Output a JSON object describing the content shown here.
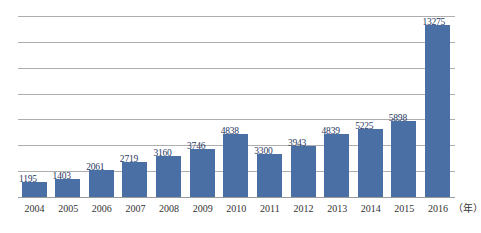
{
  "chart_data": {
    "type": "bar",
    "title": "",
    "xlabel": "年",
    "ylabel": "",
    "categories": [
      "2004",
      "2005",
      "2006",
      "2007",
      "2008",
      "2009",
      "2010",
      "2011",
      "2012",
      "2013",
      "2014",
      "2015",
      "2016"
    ],
    "values": [
      1195,
      1403,
      2061,
      2719,
      3160,
      3746,
      4838,
      3300,
      3943,
      4839,
      5225,
      5898,
      13275
    ],
    "value_labels": [
      "1195",
      "1403",
      "2061",
      "2719",
      "3160",
      "3746",
      "4838",
      "3300",
      "3943",
      "4839",
      "5225",
      "5898",
      "13275"
    ],
    "ylim": [
      0,
      14000
    ],
    "gridlines": [
      2000,
      4000,
      6000,
      8000,
      10000,
      12000,
      14000
    ],
    "grid": true,
    "legend": null,
    "series": [
      {
        "name": "",
        "color": "#4a6fa5",
        "values": [
          1195,
          1403,
          2061,
          2719,
          3160,
          3746,
          4838,
          3300,
          3943,
          4839,
          5225,
          5898,
          13275
        ]
      }
    ]
  },
  "axis": {
    "unit_label": "（年）"
  },
  "colors": {
    "bar": "#4a6fa5",
    "gridline": "#aeaeae",
    "label_text": "#1f3864",
    "axis_text": "#333333",
    "background": "#ffffff"
  }
}
